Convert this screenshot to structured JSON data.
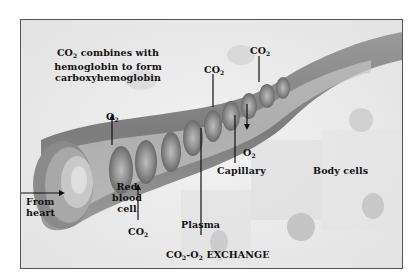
{
  "figure": {
    "title": "CO2-O2 EXCHANGE",
    "title_parts": {
      "co": "CO",
      "sub1": "2",
      "dash_o": "-O",
      "sub2": "2",
      "rest": " EXCHANGE"
    },
    "caption_lines": [
      "CO2 combines with",
      "hemoglobin to form",
      "carboxyhemoglobin"
    ],
    "caption_parts": {
      "co": "CO",
      "sub": "2",
      "line1_rest": " combines with",
      "line2": "hemoglobin to form",
      "line3": "carboxyhemoglobin"
    },
    "labels": {
      "from_heart": [
        "From",
        "heart"
      ],
      "red_blood_cell": [
        "Red",
        "blood",
        "cell"
      ],
      "plasma": "Plasma",
      "capillary": "Capillary",
      "body_cells": "Body cells",
      "o2_left": {
        "base": "O",
        "sub": "2"
      },
      "o2_right": {
        "base": "O",
        "sub": "2"
      },
      "co2_bottom": {
        "base": "CO",
        "sub": "2"
      },
      "co2_mid": {
        "base": "CO",
        "sub": "2"
      },
      "co2_top": {
        "base": "CO",
        "sub": "2"
      }
    },
    "colors": {
      "background": "#eeeeee",
      "vessel": "#8a8a8a",
      "frame": "#555555",
      "text": "#111111"
    }
  }
}
